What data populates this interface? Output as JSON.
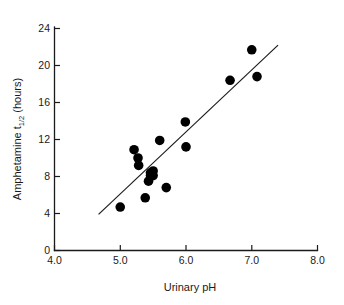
{
  "chart_data": {
    "type": "scatter",
    "title": "",
    "xlabel": "Urinary pH",
    "ylabel": "Amphetamine t",
    "ylabel_sub": "1/2",
    "ylabel_tail": " (hours)",
    "xlim": [
      4.0,
      8.0
    ],
    "ylim": [
      0,
      24
    ],
    "grid": false,
    "legend": "none",
    "xticks": [
      "4.0",
      "5.0",
      "6.0",
      "7.0",
      "8.0"
    ],
    "xtick_values": [
      4.0,
      5.0,
      6.0,
      7.0,
      8.0
    ],
    "yticks": [
      "0",
      "4",
      "8",
      "12",
      "16",
      "20",
      "24"
    ],
    "ytick_values": [
      0,
      4,
      8,
      12,
      16,
      20,
      24
    ],
    "marker": "filled-circle",
    "marker_color": "#000000",
    "marker_size": 5.4,
    "points": [
      {
        "x": 5.0,
        "y": 4.7
      },
      {
        "x": 5.21,
        "y": 10.9
      },
      {
        "x": 5.27,
        "y": 10.0
      },
      {
        "x": 5.28,
        "y": 9.2
      },
      {
        "x": 5.38,
        "y": 5.7
      },
      {
        "x": 5.43,
        "y": 7.5
      },
      {
        "x": 5.46,
        "y": 8.4
      },
      {
        "x": 5.5,
        "y": 8.6
      },
      {
        "x": 5.5,
        "y": 8.1
      },
      {
        "x": 5.46,
        "y": 8.1
      },
      {
        "x": 5.6,
        "y": 11.9
      },
      {
        "x": 5.7,
        "y": 6.8
      },
      {
        "x": 5.99,
        "y": 13.9
      },
      {
        "x": 6.0,
        "y": 11.2
      },
      {
        "x": 6.67,
        "y": 18.4
      },
      {
        "x": 7.0,
        "y": 21.7
      },
      {
        "x": 7.08,
        "y": 18.8
      }
    ],
    "fit_line": {
      "label": "regression-line",
      "x0": 4.67,
      "y0": 3.9,
      "x1": 7.4,
      "y1": 22.2
    }
  }
}
